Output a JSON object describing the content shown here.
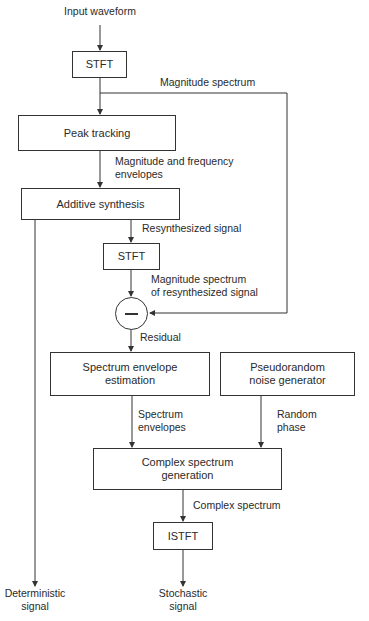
{
  "diagram": {
    "type": "flowchart",
    "nodes": {
      "input": "Input waveform",
      "stft1": "STFT",
      "peak_tracking": "Peak tracking",
      "additive_synthesis": "Additive synthesis",
      "stft2": "STFT",
      "subtract": "—",
      "spectrum_envelope": "Spectrum envelope estimation",
      "pseudorandom": "Pseudorandom noise generator",
      "complex_spectrum_gen": "Complex spectrum generation",
      "istft": "ISTFT",
      "deterministic_output": "Deterministic signal",
      "stochastic_output": "Stochastic signal"
    },
    "edge_labels": {
      "magnitude_spectrum": "Magnitude spectrum",
      "mag_freq_envelopes": "Magnitude and frequency envelopes",
      "resynthesized_signal": "Resynthesized signal",
      "mag_spectrum_resynth": "Magnitude spectrum of resynthesized signal",
      "residual": "Residual",
      "spectrum_envelopes": "Spectrum envelopes",
      "random_phase": "Random phase",
      "complex_spectrum": "Complex spectrum"
    },
    "text": {
      "input": "Input waveform",
      "stft1": "STFT",
      "magnitude_spectrum": "Magnitude spectrum",
      "peak_tracking": "Peak tracking",
      "mag_freq_line1": "Magnitude and frequency",
      "mag_freq_line2": "envelopes",
      "additive_synthesis": "Additive synthesis",
      "resynthesized_signal": "Resynthesized signal",
      "stft2": "STFT",
      "mag_resynth_line1": "Magnitude spectrum",
      "mag_resynth_line2": "of resynthesized signal",
      "residual": "Residual",
      "spec_env_line1": "Spectrum envelope",
      "spec_env_line2": "estimation",
      "pseudo_line1": "Pseudorandom",
      "pseudo_line2": "noise generator",
      "spec_envelopes_line1": "Spectrum",
      "spec_envelopes_line2": "envelopes",
      "random_phase_line1": "Random",
      "random_phase_line2": "phase",
      "complex_gen_line1": "Complex spectrum",
      "complex_gen_line2": "generation",
      "complex_spectrum": "Complex spectrum",
      "istft": "ISTFT",
      "deterministic_line1": "Deterministic",
      "deterministic_line2": "signal",
      "stochastic_line1": "Stochastic",
      "stochastic_line2": "signal"
    }
  }
}
